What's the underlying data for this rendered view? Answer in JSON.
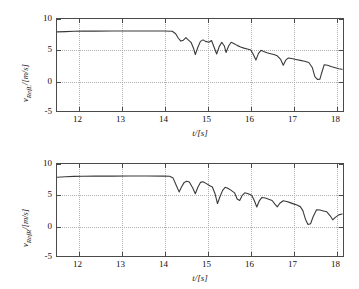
{
  "figure": {
    "type": "multi-panel-line-chart",
    "background": "#ffffff",
    "line_color": "#3a3a3a",
    "grid_color": "#b0b0b0",
    "axis_color": "#4a4a4a"
  },
  "panels": [
    {
      "name": "reference-velocity-left",
      "ylabel": "v_RefL/[m/s]",
      "ylabel_var": "v",
      "ylabel_sub": "RefL",
      "ylabel_unit": "/[m/s]",
      "xlabel": "t/[s]"
    },
    {
      "name": "reference-velocity-right",
      "ylabel": "v_RefR/[m/s]",
      "ylabel_var": "v",
      "ylabel_sub": "RefR",
      "ylabel_unit": "/[m/s]",
      "xlabel": "t/[s]"
    }
  ],
  "chart_data": [
    {
      "type": "line",
      "title": "",
      "xlabel": "t/[s]",
      "ylabel": "v_RefL/[m/s]",
      "xlim": [
        11.5,
        18.2
      ],
      "ylim": [
        -5,
        10
      ],
      "xticks": [
        12,
        13,
        14,
        15,
        16,
        17,
        18
      ],
      "yticks": [
        -5,
        0,
        5,
        10
      ],
      "xtick_labels": [
        "12",
        "13",
        "14",
        "15",
        "16",
        "17",
        "18"
      ],
      "ytick_labels": [
        "-5",
        "0",
        "5",
        "10"
      ],
      "grid": true,
      "legend": null,
      "series": [
        {
          "name": "v_RefL",
          "color": "#3a3a3a",
          "x": [
            11.5,
            11.7,
            11.9,
            12.1,
            12.4,
            12.8,
            13.2,
            13.6,
            14.0,
            14.2,
            14.28,
            14.34,
            14.4,
            14.46,
            14.52,
            14.58,
            14.64,
            14.7,
            14.74,
            14.8,
            14.86,
            14.92,
            14.98,
            15.06,
            15.12,
            15.18,
            15.24,
            15.3,
            15.36,
            15.42,
            15.46,
            15.52,
            15.58,
            15.64,
            15.72,
            15.8,
            15.88,
            15.96,
            16.04,
            16.1,
            16.16,
            16.22,
            16.28,
            16.34,
            16.42,
            16.5,
            16.58,
            16.66,
            16.74,
            16.8,
            16.86,
            16.92,
            17.0,
            17.1,
            17.2,
            17.3,
            17.4,
            17.48,
            17.54,
            17.6,
            17.66,
            17.7,
            17.76,
            17.84,
            17.92,
            18.0,
            18.1,
            18.18
          ],
          "y": [
            7.9,
            7.95,
            8.0,
            8.02,
            8.03,
            8.04,
            8.05,
            8.05,
            8.04,
            8.0,
            7.6,
            6.9,
            6.4,
            6.55,
            6.95,
            6.55,
            6.2,
            5.2,
            4.2,
            5.4,
            6.35,
            6.6,
            6.35,
            6.2,
            6.5,
            5.4,
            4.3,
            5.5,
            6.2,
            5.6,
            4.55,
            5.6,
            6.2,
            6.0,
            5.7,
            5.45,
            5.25,
            5.1,
            4.95,
            4.2,
            3.3,
            4.4,
            4.9,
            4.7,
            4.5,
            4.35,
            4.2,
            4.0,
            3.4,
            2.45,
            3.3,
            3.65,
            3.55,
            3.4,
            3.25,
            3.1,
            2.9,
            2.1,
            0.6,
            0.15,
            0.2,
            1.2,
            2.55,
            2.45,
            2.25,
            2.1,
            1.9,
            1.8
          ]
        }
      ]
    },
    {
      "type": "line",
      "title": "",
      "xlabel": "t/[s]",
      "ylabel": "v_RefR/[m/s]",
      "xlim": [
        11.5,
        18.2
      ],
      "ylim": [
        -5,
        10
      ],
      "xticks": [
        12,
        13,
        14,
        15,
        16,
        17,
        18
      ],
      "yticks": [
        -5,
        0,
        5,
        10
      ],
      "xtick_labels": [
        "12",
        "13",
        "14",
        "15",
        "16",
        "17",
        "18"
      ],
      "ytick_labels": [
        "-5",
        "0",
        "5",
        "10"
      ],
      "grid": true,
      "legend": null,
      "series": [
        {
          "name": "v_RefR",
          "color": "#3a3a3a",
          "x": [
            11.5,
            11.7,
            11.9,
            12.1,
            12.4,
            12.8,
            13.2,
            13.6,
            14.0,
            14.14,
            14.22,
            14.3,
            14.36,
            14.42,
            14.48,
            14.54,
            14.6,
            14.68,
            14.74,
            14.8,
            14.86,
            14.92,
            15.0,
            15.08,
            15.14,
            15.2,
            15.26,
            15.32,
            15.38,
            15.44,
            15.5,
            15.58,
            15.66,
            15.72,
            15.78,
            15.84,
            15.9,
            15.98,
            16.06,
            16.12,
            16.18,
            16.24,
            16.3,
            16.38,
            16.46,
            16.54,
            16.6,
            16.66,
            16.72,
            16.8,
            16.88,
            16.96,
            17.04,
            17.12,
            17.2,
            17.26,
            17.32,
            17.38,
            17.44,
            17.5,
            17.58,
            17.66,
            17.74,
            17.82,
            17.9,
            17.96,
            18.02,
            18.1,
            18.18
          ],
          "y": [
            7.85,
            7.92,
            7.98,
            8.0,
            8.02,
            8.03,
            8.04,
            8.04,
            8.03,
            8.0,
            7.7,
            6.4,
            5.45,
            6.3,
            7.0,
            7.2,
            7.05,
            6.1,
            5.15,
            6.2,
            7.0,
            7.1,
            6.8,
            6.45,
            6.25,
            5.2,
            3.55,
            4.7,
            5.7,
            6.2,
            6.05,
            5.7,
            5.3,
            4.3,
            4.05,
            4.9,
            5.3,
            5.15,
            4.9,
            4.1,
            3.0,
            4.0,
            4.55,
            4.45,
            4.25,
            4.05,
            3.5,
            3.0,
            3.6,
            4.0,
            3.9,
            3.7,
            3.5,
            3.3,
            3.05,
            2.4,
            1.0,
            0.15,
            0.25,
            1.4,
            2.55,
            2.5,
            2.35,
            2.2,
            1.55,
            0.9,
            1.3,
            1.7,
            1.85
          ]
        }
      ]
    }
  ]
}
